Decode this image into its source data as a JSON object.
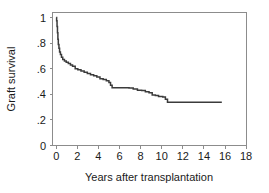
{
  "chart_data": {
    "type": "line",
    "title": "",
    "subtitle": "",
    "xlabel": "Years after transplantation",
    "ylabel": "Graft survival",
    "xlim": [
      -0.6,
      18.8
    ],
    "ylim": [
      -0.03,
      1.05
    ],
    "xticks": [
      0,
      2,
      4,
      6,
      8,
      10,
      12,
      14,
      16,
      18
    ],
    "xticklabels": [
      "0",
      "2",
      "4",
      "6",
      "8",
      "10",
      "12",
      "14",
      "16",
      "18"
    ],
    "yticks": [
      0,
      0.2,
      0.4,
      0.6,
      0.8,
      1
    ],
    "yticklabels": [
      "0",
      ".2",
      ".4",
      ".6",
      ".8",
      "1"
    ],
    "grid": false,
    "legend": null,
    "legend_position": "none",
    "series": [
      {
        "name": "Graft survival (Kaplan-Meier)",
        "style": "step-post",
        "color": "#3b3b3b",
        "x": [
          0.0,
          0.04,
          0.08,
          0.12,
          0.16,
          0.2,
          0.26,
          0.32,
          0.4,
          0.5,
          0.62,
          0.78,
          0.95,
          1.15,
          1.35,
          1.55,
          1.8,
          2.05,
          2.35,
          2.65,
          2.95,
          3.25,
          3.55,
          3.85,
          4.15,
          4.45,
          4.75,
          5.0,
          5.15,
          5.3,
          6.4,
          6.9,
          7.3,
          7.7,
          8.1,
          8.45,
          8.8,
          9.1,
          9.4,
          9.7,
          10.1,
          10.35,
          10.55,
          15.7
        ],
        "y": [
          1.0,
          0.975,
          0.93,
          0.88,
          0.83,
          0.79,
          0.76,
          0.73,
          0.71,
          0.69,
          0.672,
          0.66,
          0.65,
          0.64,
          0.628,
          0.62,
          0.6,
          0.592,
          0.582,
          0.572,
          0.562,
          0.552,
          0.545,
          0.535,
          0.522,
          0.515,
          0.505,
          0.492,
          0.47,
          0.452,
          0.452,
          0.45,
          0.442,
          0.432,
          0.43,
          0.42,
          0.412,
          0.395,
          0.39,
          0.382,
          0.378,
          0.362,
          0.338,
          0.338
        ],
        "final_value": 0.338,
        "start_value": 1.0,
        "censor_end_x": 15.7
      }
    ],
    "annotations": []
  },
  "figure": {
    "background_color": "#ffffff",
    "frame_color": "#8c8c8c",
    "text_color": "#1a1a1a",
    "curve_color": "#3b3b3b"
  }
}
